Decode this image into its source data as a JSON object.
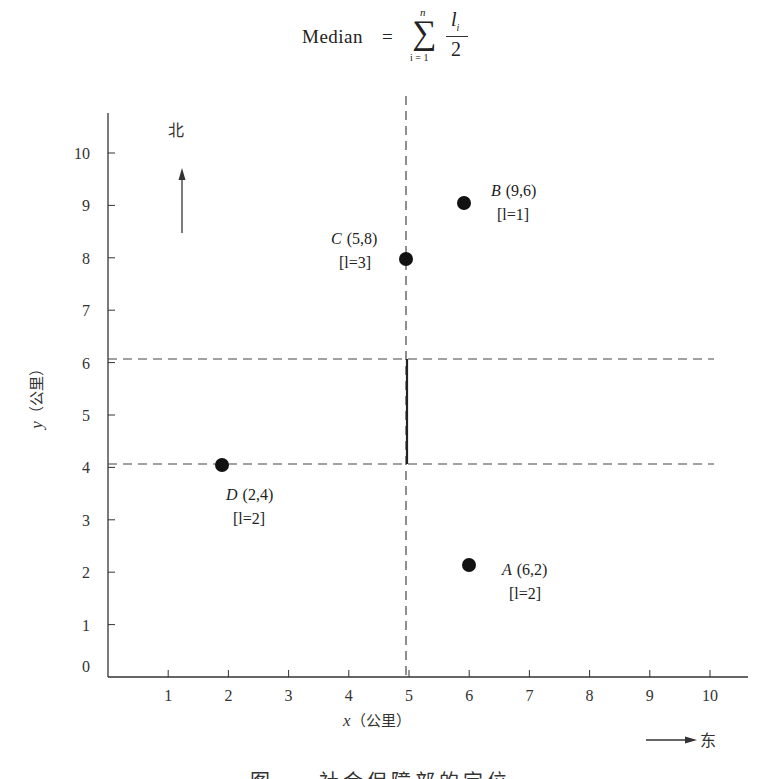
{
  "formula": {
    "lhs": "Median",
    "eq": "=",
    "sigma": "∑",
    "upper": "n",
    "lower": "i = 1",
    "numerator": "l",
    "numerator_sub": "i",
    "denominator": "2"
  },
  "compass": {
    "north": "北",
    "east": "东"
  },
  "caption": "图 — 社会保障部的定位",
  "chart_data": {
    "type": "scatter",
    "title": "",
    "xlabel": "x（公里）",
    "ylabel": "y（公里）",
    "xlim": [
      0,
      10.6
    ],
    "ylim": [
      0,
      10.8
    ],
    "x_ticks": [
      1,
      2,
      3,
      4,
      5,
      6,
      7,
      8,
      9,
      10
    ],
    "y_ticks": [
      0,
      1,
      2,
      3,
      4,
      5,
      6,
      7,
      8,
      9,
      10
    ],
    "grid": false,
    "points": [
      {
        "name": "A",
        "label": "A (6,2)",
        "weight_label": "[l=2]",
        "x": 6,
        "y": 2,
        "l": 2
      },
      {
        "name": "B",
        "label": "B (9,6)",
        "weight_label": "[l=1]",
        "x": 9,
        "y": 6,
        "l": 1
      },
      {
        "name": "C",
        "label": "C (5,8)",
        "weight_label": "[l=3]",
        "x": 5,
        "y": 8,
        "l": 3
      },
      {
        "name": "D",
        "label": "D (2,4)",
        "weight_label": "[l=2]",
        "x": 2,
        "y": 4,
        "l": 2
      }
    ],
    "reference_lines": [
      {
        "orientation": "vertical",
        "value": 5,
        "style": "dashed",
        "label": "x median"
      },
      {
        "orientation": "horizontal",
        "value": 6,
        "style": "dashed"
      },
      {
        "orientation": "horizontal",
        "value": 4,
        "style": "dashed"
      }
    ],
    "optimal_segment": {
      "x": 5,
      "y_from": 4,
      "y_to": 6,
      "style": "solid"
    },
    "annotations": [
      "北 (north arrow)",
      "东 (east arrow)"
    ]
  }
}
